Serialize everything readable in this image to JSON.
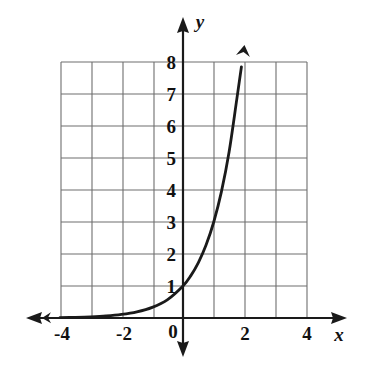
{
  "chart_data": {
    "type": "line",
    "title": "",
    "subtitle": "",
    "xlabel": "x",
    "ylabel": "y",
    "xlim": [
      -4,
      4
    ],
    "ylim": [
      0,
      8
    ],
    "grid": true,
    "legend": false,
    "legend_position": "none",
    "x_ticks": [
      "-4",
      "-2",
      "0",
      "2",
      "4"
    ],
    "x_tick_values": [
      -4,
      -2,
      0,
      2,
      4
    ],
    "y_ticks": [
      "1",
      "2",
      "3",
      "4",
      "5",
      "6",
      "7",
      "8"
    ],
    "y_tick_values": [
      1,
      2,
      3,
      4,
      5,
      6,
      7,
      8
    ],
    "origin_label": "0",
    "grid_step_x": 1,
    "grid_step_y": 1,
    "annotations": [
      "curve has arrowhead at left end near y = 0",
      "curve has arrowhead at upper right end near (1.9, 8)"
    ],
    "series": [
      {
        "name": "y = 3^x",
        "equation": "y = 3^x",
        "color": "#1a1a1a",
        "x": [
          -4.0,
          -3.5,
          -3.0,
          -2.5,
          -2.0,
          -1.5,
          -1.0,
          -0.5,
          0.0,
          0.25,
          0.5,
          0.75,
          1.0,
          1.25,
          1.5,
          1.75,
          1.9
        ],
        "values": [
          0.012,
          0.021,
          0.037,
          0.064,
          0.111,
          0.192,
          0.333,
          0.577,
          1.0,
          1.316,
          1.732,
          2.28,
          3.0,
          3.948,
          5.196,
          6.84,
          7.85
        ]
      }
    ]
  },
  "axes": {
    "x_axis_name": "x",
    "y_axis_name": "y"
  },
  "colors": {
    "grid": "#6e6e6e",
    "axis": "#1a1a1a",
    "curve": "#1a1a1a",
    "background": "#ffffff"
  }
}
